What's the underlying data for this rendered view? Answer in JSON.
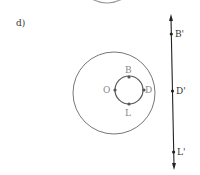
{
  "figure": {
    "part_label": "d)",
    "colors": {
      "circle": "#777777",
      "line": "#222222",
      "label_gray": "#888888",
      "label_dark": "#333333",
      "top_arc": "#999999"
    },
    "circle_points": [
      {
        "name": "B",
        "x": 129,
        "y": 77,
        "lx": 126,
        "ly": 74
      },
      {
        "name": "O",
        "x": 115,
        "y": 90,
        "lx": 104,
        "ly": 93
      },
      {
        "name": "D",
        "x": 144,
        "y": 90,
        "lx": 145,
        "ly": 93
      },
      {
        "name": "L",
        "x": 129,
        "y": 104,
        "lx": 126,
        "ly": 116
      }
    ],
    "line_points": [
      {
        "name": "B'",
        "y": 34
      },
      {
        "name": "D'",
        "y": 91
      },
      {
        "name": "L'",
        "y": 152
      }
    ]
  }
}
